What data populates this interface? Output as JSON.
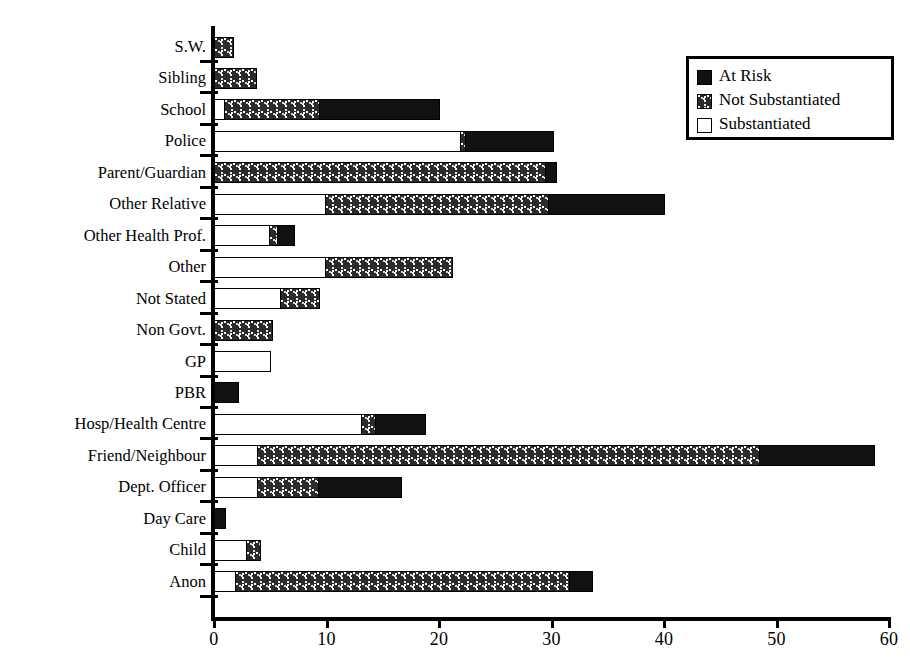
{
  "chart_data": {
    "type": "bar",
    "orientation": "horizontal",
    "stacked": true,
    "title": "",
    "xlabel": "",
    "ylabel": "",
    "xlim": [
      0,
      60
    ],
    "xticks": [
      0,
      10,
      20,
      30,
      40,
      50,
      60
    ],
    "grid": false,
    "legend_position": "top-right",
    "categories": [
      "S.W.",
      "Sibling",
      "School",
      "Police",
      "Parent/Guardian",
      "Other Relative",
      "Other Health Prof.",
      "Other",
      "Not Stated",
      "Non Govt.",
      "GP",
      "PBR",
      "Hosp/Health Centre",
      "Friend/Neighbour",
      "Dept. Officer",
      "Day Care",
      "Child",
      "Anon"
    ],
    "series": [
      {
        "name": "Substantiated",
        "fill": "white",
        "values": [
          0,
          0,
          1.0,
          22.0,
          0,
          10.0,
          5.0,
          10.0,
          6.0,
          0,
          5.1,
          0,
          13.2,
          4.0,
          4.0,
          0,
          3.0,
          2.0
        ]
      },
      {
        "name": "Not Substantiated",
        "fill": "stipple",
        "values": [
          1.8,
          3.8,
          8.6,
          0.6,
          29.6,
          20.0,
          0.9,
          11.4,
          3.6,
          5.2,
          0,
          0,
          1.4,
          44.7,
          5.5,
          0,
          1.3,
          29.8
        ]
      },
      {
        "name": "At Risk",
        "fill": "black",
        "values": [
          0,
          0,
          10.8,
          7.9,
          1.0,
          10.4,
          1.6,
          0,
          0,
          0,
          0,
          2.2,
          4.5,
          10.3,
          7.5,
          1.1,
          0,
          2.2
        ]
      }
    ],
    "totals": [
      1.8,
      3.8,
      20.4,
      30.5,
      30.6,
      40.4,
      7.5,
      21.4,
      9.6,
      5.2,
      5.1,
      2.2,
      19.1,
      59.0,
      17.0,
      1.1,
      4.3,
      34.0
    ]
  },
  "legend": {
    "entries": [
      {
        "label": "At Risk",
        "swatch": "black"
      },
      {
        "label": "Not Substantiated",
        "swatch": "stipple"
      },
      {
        "label": "Substantiated",
        "swatch": "white"
      }
    ]
  },
  "axis": {
    "x_tick_labels": [
      "0",
      "10",
      "20",
      "30",
      "40",
      "50",
      "60"
    ]
  },
  "colors": {
    "at_risk": "#111111",
    "not_substantiated": "#2b2b2b",
    "substantiated": "#ffffff",
    "axis": "#000000",
    "background": "#ffffff"
  }
}
